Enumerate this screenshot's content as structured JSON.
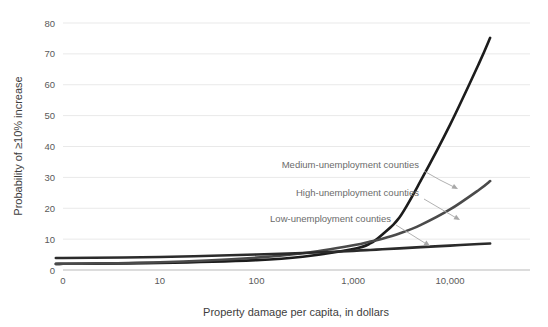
{
  "chart_data": {
    "type": "line",
    "title": "",
    "xlabel": "Property damage per capita, in dollars",
    "ylabel": "Probability of ≥10% increase",
    "xscale": "log",
    "xlim": [
      0,
      30000
    ],
    "ylim": [
      0,
      80
    ],
    "grid": true,
    "legend_position": "inline-annotations",
    "xticks": [
      "0",
      "10",
      "100",
      "1,000",
      "10,000"
    ],
    "yticks": [
      "0",
      "10",
      "20",
      "30",
      "40",
      "50",
      "60",
      "70",
      "80"
    ],
    "series": [
      {
        "name": "Medium-unemployment counties",
        "color": "#1c1c1c",
        "x": [
          0,
          1,
          10,
          100,
          300,
          1000,
          1500,
          2000,
          3000,
          5000,
          10000,
          20000,
          26000
        ],
        "values": [
          2.0,
          2.0,
          2.3,
          3.2,
          4.3,
          6.8,
          8.6,
          11.5,
          17.0,
          29.0,
          47.0,
          67.0,
          75.2
        ]
      },
      {
        "name": "High-unemployment counties",
        "color": "#4a4a4a",
        "x": [
          0,
          1,
          10,
          100,
          300,
          1000,
          1500,
          2000,
          3000,
          5000,
          10000,
          20000,
          26000
        ],
        "values": [
          2.0,
          2.0,
          2.5,
          4.0,
          5.4,
          8.0,
          9.2,
          10.1,
          11.8,
          14.6,
          19.6,
          26.0,
          28.8
        ]
      },
      {
        "name": "Low-unemployment counties",
        "color": "#2b2b2b",
        "x": [
          0,
          1,
          10,
          100,
          300,
          1000,
          1500,
          2000,
          3000,
          5000,
          10000,
          20000,
          26000
        ],
        "values": [
          3.9,
          3.9,
          4.2,
          5.0,
          5.5,
          6.2,
          6.5,
          6.7,
          7.0,
          7.4,
          7.9,
          8.4,
          8.6
        ]
      }
    ],
    "annotations": [
      {
        "text": "Medium-unemployment counties",
        "label_x": 419,
        "label_y": 168,
        "leader": "M 424 171 L 440 180 L 456 188",
        "arrow_at": [
          458,
          189
        ],
        "arrow_angle": 28
      },
      {
        "text": "High-unemployment counties",
        "label_x": 419,
        "label_y": 196,
        "leader": "M 424 199 L 441 209 L 458 219",
        "arrow_at": [
          460,
          220
        ],
        "arrow_angle": 30
      },
      {
        "text": "Low-unemployment counties",
        "label_x": 391,
        "label_y": 222,
        "leader": "M 396 225 L 412 235 L 428 245",
        "arrow_at": [
          430,
          246
        ],
        "arrow_angle": 32
      }
    ]
  }
}
